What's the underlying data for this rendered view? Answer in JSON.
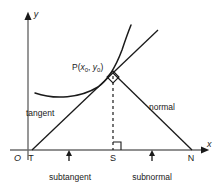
{
  "figure": {
    "stroke_color": "#1a1a1a",
    "background_color": "#ffffff",
    "axes": {
      "x_label": "x",
      "y_label": "y",
      "origin_label": "O"
    },
    "points": [
      {
        "name": "point-label-P",
        "label": "P(",
        "sub1": "x",
        "sub1sub": "0",
        "comma": ", ",
        "sub2": "y",
        "sub2sub": "0",
        "close": ")"
      }
    ],
    "vertices": {
      "t_label": "T",
      "s_label": "S",
      "n_label": "N"
    },
    "lines": {
      "tangent_label": "tangent",
      "normal_label": "normal"
    },
    "measures": {
      "subtangent_label": "subtangent",
      "subnormal_label": "subnormal"
    },
    "markers": {
      "right_angle_at_p": "right-angle-marker",
      "right_angle_at_s": "right-angle-marker",
      "subtangent_arrow": "up-arrow",
      "subnormal_arrow": "up-arrow"
    }
  }
}
